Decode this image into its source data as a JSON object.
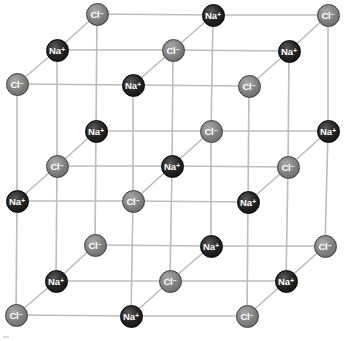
{
  "diagram": {
    "colors": {
      "na": "#1a1a1a",
      "cl": "#858585",
      "bond": "#bdbdbd",
      "background": "#ffffff"
    },
    "grid": {
      "origin": [
        17,
        84
      ],
      "x_step": [
        116,
        1
      ],
      "y_step": [
        0,
        116
      ],
      "depth_step": [
        39.5,
        -35
      ]
    },
    "ions": [
      {
        "symbol": "Cl",
        "charge": "−",
        "type": "cl",
        "i": 0,
        "j": 0,
        "k": 0,
        "x": 17,
        "y": 84
      },
      {
        "symbol": "Na",
        "charge": "+",
        "type": "na",
        "i": 1,
        "j": 0,
        "k": 0,
        "x": 133,
        "y": 85
      },
      {
        "symbol": "Cl",
        "charge": "−",
        "type": "cl",
        "i": 2,
        "j": 0,
        "k": 0,
        "x": 249,
        "y": 86
      },
      {
        "symbol": "Na",
        "charge": "+",
        "type": "na",
        "i": 0,
        "j": 1,
        "k": 0,
        "x": 17,
        "y": 201
      },
      {
        "symbol": "Cl",
        "charge": "−",
        "type": "cl",
        "i": 1,
        "j": 1,
        "k": 0,
        "x": 133,
        "y": 201
      },
      {
        "symbol": "Na",
        "charge": "+",
        "type": "na",
        "i": 2,
        "j": 1,
        "k": 0,
        "x": 248,
        "y": 202
      },
      {
        "symbol": "Cl",
        "charge": "−",
        "type": "cl",
        "i": 0,
        "j": 2,
        "k": 0,
        "x": 16,
        "y": 315
      },
      {
        "symbol": "Na",
        "charge": "+",
        "type": "na",
        "i": 1,
        "j": 2,
        "k": 0,
        "x": 131,
        "y": 316
      },
      {
        "symbol": "Cl",
        "charge": "−",
        "type": "cl",
        "i": 2,
        "j": 2,
        "k": 0,
        "x": 247,
        "y": 316
      },
      {
        "symbol": "Na",
        "charge": "+",
        "type": "na",
        "i": 0,
        "j": 0,
        "k": 1,
        "x": 57,
        "y": 50
      },
      {
        "symbol": "Cl",
        "charge": "−",
        "type": "cl",
        "i": 1,
        "j": 0,
        "k": 1,
        "x": 173,
        "y": 50
      },
      {
        "symbol": "Na",
        "charge": "+",
        "type": "na",
        "i": 2,
        "j": 0,
        "k": 1,
        "x": 289,
        "y": 51
      },
      {
        "symbol": "Cl",
        "charge": "−",
        "type": "cl",
        "i": 0,
        "j": 1,
        "k": 1,
        "x": 57,
        "y": 166
      },
      {
        "symbol": "Na",
        "charge": "+",
        "type": "na",
        "i": 1,
        "j": 1,
        "k": 1,
        "x": 172,
        "y": 166
      },
      {
        "symbol": "Cl",
        "charge": "−",
        "type": "cl",
        "i": 2,
        "j": 1,
        "k": 1,
        "x": 288,
        "y": 167
      },
      {
        "symbol": "Na",
        "charge": "+",
        "type": "na",
        "i": 0,
        "j": 2,
        "k": 1,
        "x": 56,
        "y": 281
      },
      {
        "symbol": "Cl",
        "charge": "−",
        "type": "cl",
        "i": 1,
        "j": 2,
        "k": 1,
        "x": 170,
        "y": 281
      },
      {
        "symbol": "Na",
        "charge": "+",
        "type": "na",
        "i": 2,
        "j": 2,
        "k": 1,
        "x": 286,
        "y": 281
      },
      {
        "symbol": "Cl",
        "charge": "−",
        "type": "cl",
        "i": 0,
        "j": 0,
        "k": 2,
        "x": 97,
        "y": 14
      },
      {
        "symbol": "Na",
        "charge": "+",
        "type": "na",
        "i": 1,
        "j": 0,
        "k": 2,
        "x": 213,
        "y": 15
      },
      {
        "symbol": "Cl",
        "charge": "−",
        "type": "cl",
        "i": 2,
        "j": 0,
        "k": 2,
        "x": 328,
        "y": 15
      },
      {
        "symbol": "Na",
        "charge": "+",
        "type": "na",
        "i": 0,
        "j": 1,
        "k": 2,
        "x": 96,
        "y": 131
      },
      {
        "symbol": "Cl",
        "charge": "−",
        "type": "cl",
        "i": 1,
        "j": 1,
        "k": 2,
        "x": 211,
        "y": 131
      },
      {
        "symbol": "Na",
        "charge": "+",
        "type": "na",
        "i": 2,
        "j": 1,
        "k": 2,
        "x": 328,
        "y": 131
      },
      {
        "symbol": "Cl",
        "charge": "−",
        "type": "cl",
        "i": 0,
        "j": 2,
        "k": 2,
        "x": 95,
        "y": 245
      },
      {
        "symbol": "Na",
        "charge": "+",
        "type": "na",
        "i": 1,
        "j": 2,
        "k": 2,
        "x": 211,
        "y": 246
      },
      {
        "symbol": "Cl",
        "charge": "−",
        "type": "cl",
        "i": 2,
        "j": 2,
        "k": 2,
        "x": 325,
        "y": 246
      }
    ]
  }
}
